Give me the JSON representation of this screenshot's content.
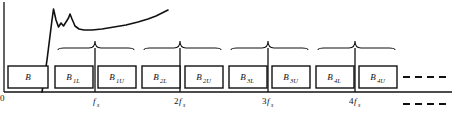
{
  "figure": {
    "width": 452,
    "height": 113,
    "background": "#ffffff",
    "ink_color": "#111111"
  },
  "axes": {
    "origin_label": "0",
    "x_axis": {
      "y": 92,
      "x_start": 4,
      "x_end": 452
    },
    "y_axis": {
      "x": 4,
      "y_start": 2,
      "y_end": 92
    },
    "ticks": [
      {
        "name": "fs",
        "prefix": "",
        "symbol": "f",
        "subscript": "s",
        "x": 95
      },
      {
        "name": "2fs",
        "prefix": "2",
        "symbol": "f",
        "subscript": "s",
        "x": 180
      },
      {
        "name": "3fs",
        "prefix": "3",
        "symbol": "f",
        "subscript": "s",
        "x": 268
      },
      {
        "name": "4fs",
        "prefix": "4",
        "symbol": "f",
        "subscript": "s",
        "x": 355
      }
    ]
  },
  "band_boxes": [
    {
      "label": "B",
      "subscript": "",
      "x": 8,
      "width": 40,
      "name": "band-box-b"
    },
    {
      "label": "B",
      "subscript": "1L",
      "x": 55,
      "width": 38,
      "name": "band-box-b1l"
    },
    {
      "label": "B",
      "subscript": "1U",
      "x": 98,
      "width": 38,
      "name": "band-box-b1u"
    },
    {
      "label": "B",
      "subscript": "2L",
      "x": 142,
      "width": 38,
      "name": "band-box-b2l"
    },
    {
      "label": "B",
      "subscript": "2U",
      "x": 185,
      "width": 38,
      "name": "band-box-b2u"
    },
    {
      "label": "B",
      "subscript": "3L",
      "x": 229,
      "width": 38,
      "name": "band-box-b3l"
    },
    {
      "label": "B",
      "subscript": "3U",
      "x": 272,
      "width": 38,
      "name": "band-box-b3u"
    },
    {
      "label": "B",
      "subscript": "4L",
      "x": 316,
      "width": 38,
      "name": "band-box-b4l"
    },
    {
      "label": "B",
      "subscript": "4U",
      "x": 359,
      "width": 38,
      "name": "band-box-b4u"
    }
  ],
  "box_geometry": {
    "y": 66,
    "height": 22
  },
  "braces": [
    {
      "name": "brace-1",
      "x_start": 58,
      "x_end": 134,
      "tip_x": 95,
      "y": 48,
      "tip_y": 41
    },
    {
      "name": "brace-2",
      "x_start": 144,
      "x_end": 221,
      "tip_x": 180,
      "y": 48,
      "tip_y": 41
    },
    {
      "name": "brace-3",
      "x_start": 231,
      "x_end": 308,
      "tip_x": 268,
      "y": 48,
      "tip_y": 41
    },
    {
      "name": "brace-4",
      "x_start": 318,
      "x_end": 395,
      "tip_x": 355,
      "y": 48,
      "tip_y": 41
    }
  ],
  "tick_lines": [
    {
      "name": "tick-line-fs",
      "x": 95,
      "y_top": 48,
      "y_bottom": 92
    },
    {
      "name": "tick-line-2fs",
      "x": 180,
      "y_top": 48,
      "y_bottom": 92
    },
    {
      "name": "tick-line-3fs",
      "x": 268,
      "y_top": 48,
      "y_bottom": 92
    },
    {
      "name": "tick-line-4fs",
      "x": 355,
      "y_top": 48,
      "y_bottom": 92
    }
  ],
  "continuation_dashes": {
    "upper": {
      "name": "dashes-upper",
      "y": 77,
      "x_start": 403,
      "x_end": 450,
      "dash": "7 5"
    },
    "lower": {
      "name": "dashes-lower",
      "y": 104,
      "x_start": 403,
      "x_end": 450,
      "dash": "7 5"
    }
  },
  "response_curve": {
    "name": "response-curve",
    "description": "noise / gain response curve rising steeply then peaking and settling",
    "path": "M 42 92 L 44 80 L 47 60 L 50 36 L 52 20 L 53.5 9 L 56 20 L 58.5 27 L 61 23 L 63.5 26 L 66 22 L 68.5 18 L 70 14 L 72 19 L 75 26 L 79 29 L 84 30 L 92 30 L 102 29 L 114 27 L 126 25 L 138 22 L 148 19 L 156 16 L 162 13 L 166 11 L 168 10",
    "stroke_width": 1.6
  }
}
